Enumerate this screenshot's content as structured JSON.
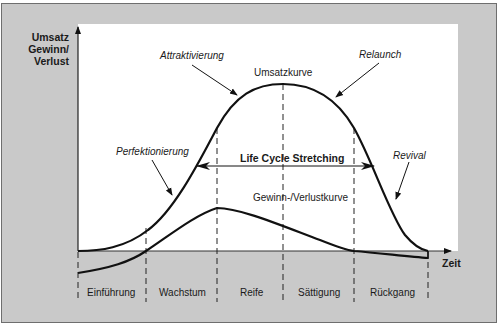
{
  "axes": {
    "y_label_lines": [
      "Umsatz",
      "Gewinn/",
      "Verlust"
    ],
    "x_label": "Zeit"
  },
  "curves": {
    "revenue": "Umsatzkurve",
    "profit": "Gewinn-/Verlustkurve"
  },
  "annotations": {
    "attraktivierung": "Attraktivierung",
    "relaunch": "Relaunch",
    "perfektionierung": "Perfektionierung",
    "revival": "Revival",
    "stretching": "Life Cycle Stretching"
  },
  "phases": [
    "Einführung",
    "Wachstum",
    "Reife",
    "Sättigung",
    "Rückgang"
  ],
  "colors": {
    "frame_bg": "#c9c9c9",
    "plot_bg": "#ffffff",
    "line": "#111111"
  }
}
